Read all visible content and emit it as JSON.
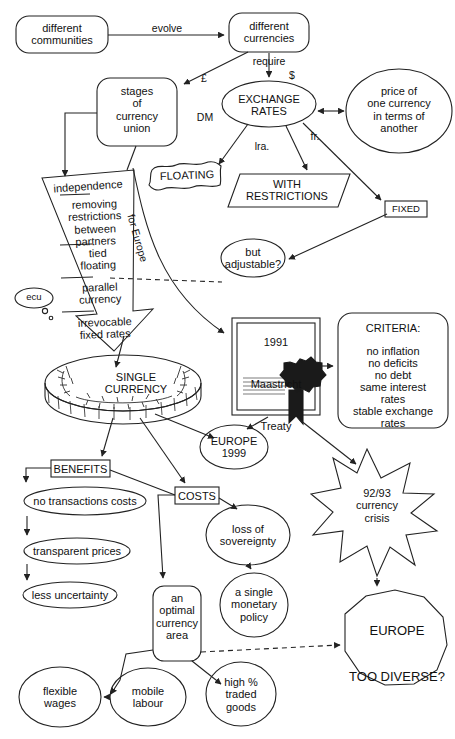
{
  "diagram": {
    "background": "#ffffff",
    "stroke": "#222222",
    "text_color": "#111111"
  },
  "nodes": {
    "different_communities": {
      "label": "different\ncommunities",
      "shape": "rounded-rect"
    },
    "different_currencies": {
      "label": "different\ncurrencies",
      "shape": "rounded-rect"
    },
    "stages_of_currency_union": {
      "label": "stages\nof\ncurrency\nunion",
      "shape": "rounded-rect"
    },
    "exchange_rates": {
      "label": "EXCHANGE\nRATES",
      "shape": "ellipse"
    },
    "price_of_one_currency": {
      "label": "price of\none currency\nin terms of\nanother",
      "shape": "circle"
    },
    "floating": {
      "label": "FLOATING",
      "shape": "flag-banner"
    },
    "with_restrictions": {
      "label": "WITH\nRESTRICTIONS",
      "shape": "parallelogram"
    },
    "fixed": {
      "label": "FIXED",
      "shape": "rect"
    },
    "but_adjustable": {
      "label": "but\nadjustable?",
      "shape": "ellipse"
    },
    "ecu": {
      "label": "ecu",
      "shape": "speech-bubble"
    },
    "maastricht_treaty": {
      "label": "1991\n\nMaastricht\n\nTreaty",
      "shape": "certificate"
    },
    "criteria": {
      "title": "CRITERIA:",
      "items": [
        "no inflation",
        "no deficits",
        "no debt",
        "same interest",
        "rates",
        "stable exchange",
        "rates"
      ],
      "shape": "rounded-rect"
    },
    "single_currency": {
      "label": "SINGLE\nCURRENCY",
      "shape": "coin"
    },
    "europe_1999": {
      "label": "EUROPE\n1999",
      "shape": "ellipse"
    },
    "benefits": {
      "label": "BENEFITS",
      "shape": "rect"
    },
    "costs": {
      "label": "COSTS",
      "shape": "rect"
    },
    "no_transactions_costs": {
      "label": "no transactions costs",
      "shape": "ellipse"
    },
    "transparent_prices": {
      "label": "transparent prices",
      "shape": "ellipse"
    },
    "less_uncertainty": {
      "label": "less uncertainty",
      "shape": "ellipse"
    },
    "loss_of_sovereignty": {
      "label": "loss of\nsovereignty",
      "shape": "ellipse"
    },
    "a_single_monetary_policy": {
      "label": "a single\nmonetary\npolicy",
      "shape": "circle"
    },
    "currency_crisis": {
      "label": "92/93\ncurrency\ncrisis",
      "shape": "star"
    },
    "an_optimal_currency_area": {
      "label": "an\noptimal\ncurrency\narea",
      "shape": "rounded-rect"
    },
    "europe_too_diverse": {
      "label": "EUROPE\n\nTOO DIVERSE?",
      "shape": "octagon"
    },
    "flexible_wages": {
      "label": "flexible\nwages",
      "shape": "ellipse"
    },
    "mobile_labour": {
      "label": "mobile\nlabour",
      "shape": "ellipse"
    },
    "high_pct_traded_goods": {
      "label": "high %\ntraded\ngoods",
      "shape": "ellipse"
    }
  },
  "stages_list": {
    "shape": "down-arrow",
    "items": [
      "independence",
      "removing\nrestrictions\nbetween\npartners",
      "tied\nfloating",
      "parallel\ncurrency",
      "irrevocable\nfixed rates"
    ]
  },
  "edge_labels": {
    "evolve": "evolve",
    "require": "require",
    "pound": "£",
    "dollar": "$",
    "dm": "DM",
    "lira": "lra.",
    "franc": "fr.",
    "for_europe": "for Europe"
  }
}
